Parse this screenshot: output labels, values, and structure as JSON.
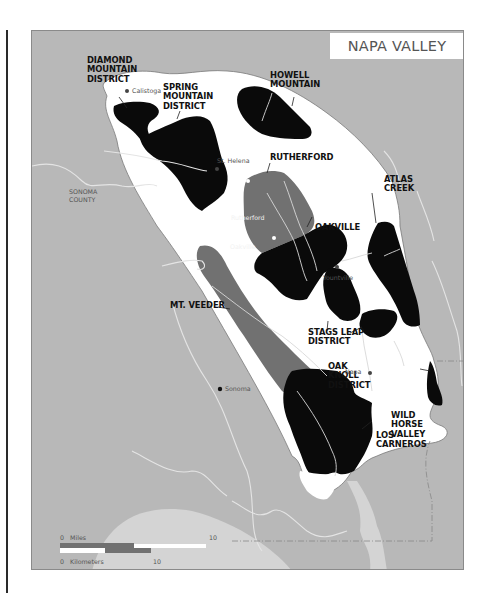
{
  "title": "NAPA VALLEY",
  "regions": [
    {
      "id": "diamond-mountain",
      "label": "DIAMOND\nMOUNTAIN\nDISTRICT",
      "fill": "black"
    },
    {
      "id": "spring-mountain",
      "label": "SPRING\nMOUNTAIN\nDISTRICT",
      "fill": "black"
    },
    {
      "id": "howell-mountain",
      "label": "HOWELL\nMOUNTAIN",
      "fill": "black"
    },
    {
      "id": "rutherford",
      "label": "RUTHERFORD",
      "fill": "dark-gray"
    },
    {
      "id": "atlas-creek",
      "label": "ATLAS\nCREEK",
      "fill": "black"
    },
    {
      "id": "oakville",
      "label": "OAKVILLE",
      "fill": "black"
    },
    {
      "id": "mt-veeder",
      "label": "MT. VEEDER",
      "fill": "dark-gray"
    },
    {
      "id": "stags-leap",
      "label": "STAGS LEAP\nDISTRICT",
      "fill": "black"
    },
    {
      "id": "oak-knoll",
      "label": "OAK\nKNOLL\nDISTRICT",
      "fill": "black"
    },
    {
      "id": "wild-horse-valley",
      "label": "WILD\nHORSE\nVALLEY",
      "fill": "black"
    },
    {
      "id": "los-carneros",
      "label": "LOS\nCARNEROS",
      "fill": "black"
    }
  ],
  "towns": [
    {
      "name": "Calistoga"
    },
    {
      "name": "St. Helena"
    },
    {
      "name": "Rutherford"
    },
    {
      "name": "Oakville"
    },
    {
      "name": "Yountville"
    },
    {
      "name": "Napa"
    },
    {
      "name": "Sonoma"
    }
  ],
  "county_label": "SONOMA\nCOUNTY",
  "scale": {
    "miles_zero": "0",
    "miles_label": "Miles",
    "miles_max": "10",
    "km_zero": "0",
    "km_label": "Kilometers",
    "km_max": "10"
  },
  "colors": {
    "land_outside": "#b8b8b8",
    "valley": "#ffffff",
    "ava_black": "#0a0a0a",
    "ava_gray": "#717171",
    "water": "#d6d6d6",
    "river": "#e6e6e6"
  }
}
